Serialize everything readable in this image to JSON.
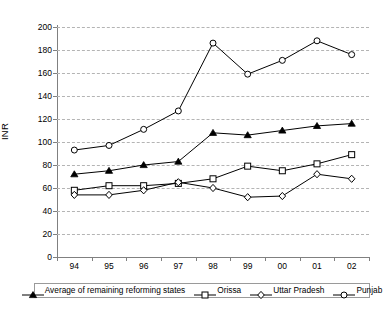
{
  "chart_data": {
    "type": "line",
    "title": "",
    "xlabel": "",
    "ylabel": "INR",
    "categories": [
      "94",
      "95",
      "96",
      "97",
      "98",
      "99",
      "00",
      "01",
      "02"
    ],
    "ylim": [
      0,
      200
    ],
    "ytick_values": [
      0,
      20,
      40,
      60,
      80,
      100,
      120,
      140,
      160,
      180,
      200
    ],
    "ytick_labels": [
      "0",
      "20",
      "40",
      "60",
      "80",
      "100",
      "120",
      "140",
      "160",
      "180",
      "200"
    ],
    "grid": "horizontal-dashed",
    "legend_position": "bottom",
    "series": [
      {
        "name": "Average of remaining reforming states",
        "marker": "filled-triangle",
        "values": [
          72,
          75,
          80,
          83,
          108,
          106,
          110,
          114,
          116
        ]
      },
      {
        "name": "Orissa",
        "marker": "open-square",
        "values": [
          58,
          62,
          62,
          64,
          68,
          79,
          75,
          81,
          89
        ]
      },
      {
        "name": "Uttar Pradesh",
        "marker": "open-diamond",
        "values": [
          54,
          54,
          58,
          65,
          60,
          52,
          53,
          72,
          68
        ]
      },
      {
        "name": "Punjab",
        "marker": "open-circle",
        "values": [
          93,
          97,
          111,
          127,
          186,
          159,
          171,
          188,
          176
        ]
      }
    ],
    "colors": {
      "line": "#000000",
      "grid": "#b4b4b4",
      "axis": "#808080",
      "background": "#ffffff"
    }
  }
}
